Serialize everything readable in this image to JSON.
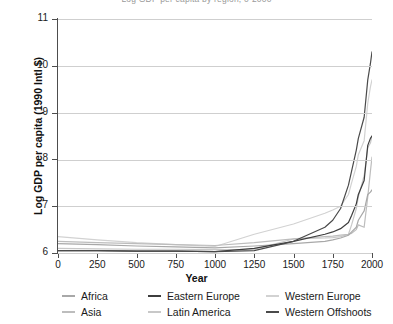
{
  "title": "Log GDP per capita by region, 0-2000",
  "axes": {
    "ylabel": "Log GDP per capita (1990 Intl $)",
    "xlabel": "Year",
    "yticks": [
      "11",
      "10",
      "9",
      "8",
      "7",
      "6"
    ],
    "xticks": [
      "0",
      "250",
      "500",
      "750",
      "1000",
      "1250",
      "1500",
      "1750",
      "2000"
    ]
  },
  "legend": {
    "row1": [
      {
        "label": "Africa",
        "color": "#a8a8a8"
      },
      {
        "label": "Eastern Europe",
        "color": "#3d3d3d"
      },
      {
        "label": "Western Europe",
        "color": "#d2d2d2"
      }
    ],
    "row2": [
      {
        "label": "Asia",
        "color": "#bdbdbd"
      },
      {
        "label": "Latin America",
        "color": "#c8c8c8"
      },
      {
        "label": "Western Offshoots",
        "color": "#4a4a4a"
      }
    ]
  },
  "chart_data": {
    "type": "line",
    "title": "Log GDP per capita by region, 0-2000",
    "xlabel": "Year",
    "ylabel": "Log GDP per capita (1990 Intl $)",
    "xlim": [
      0,
      2000
    ],
    "ylim": [
      6,
      11
    ],
    "xtick_step": 250,
    "ytick_step": 1,
    "grid": "horizontal",
    "legend_position": "below-axis",
    "x": [
      0,
      250,
      500,
      750,
      1000,
      1250,
      1500,
      1700,
      1750,
      1800,
      1850,
      1870,
      1900,
      1913,
      1950,
      1973,
      1990,
      2000
    ],
    "series": [
      {
        "name": "Africa",
        "color": "#a8a8a8",
        "values": [
          6.2,
          6.18,
          6.15,
          6.13,
          6.11,
          6.15,
          6.2,
          6.25,
          6.28,
          6.32,
          6.38,
          6.45,
          6.55,
          6.7,
          6.9,
          7.25,
          7.3,
          7.35
        ]
      },
      {
        "name": "Asia",
        "color": "#bdbdbd",
        "values": [
          6.25,
          6.22,
          6.2,
          6.18,
          6.16,
          6.22,
          6.3,
          6.35,
          6.36,
          6.38,
          6.4,
          6.42,
          6.5,
          6.6,
          6.55,
          7.2,
          7.75,
          8.05
        ]
      },
      {
        "name": "Eastern Europe",
        "color": "#3d3d3d",
        "values": [
          6.05,
          6.05,
          6.04,
          6.04,
          6.03,
          6.1,
          6.25,
          6.4,
          6.45,
          6.52,
          6.65,
          6.8,
          7.05,
          7.25,
          7.55,
          8.3,
          8.45,
          8.5
        ]
      },
      {
        "name": "Latin America",
        "color": "#c8c8c8",
        "values": [
          6.1,
          6.09,
          6.08,
          6.08,
          6.07,
          6.08,
          6.3,
          6.32,
          6.33,
          6.35,
          6.4,
          6.6,
          6.95,
          7.2,
          7.65,
          8.25,
          8.35,
          8.5
        ]
      },
      {
        "name": "Western Europe",
        "color": "#d2d2d2",
        "values": [
          6.35,
          6.28,
          6.22,
          6.18,
          6.14,
          6.4,
          6.62,
          6.85,
          6.92,
          7.0,
          7.25,
          7.5,
          7.85,
          8.1,
          8.4,
          9.2,
          9.55,
          9.7
        ]
      },
      {
        "name": "Western Offshoots",
        "color": "#4a4a4a",
        "values": [
          6.05,
          6.05,
          6.04,
          6.04,
          6.03,
          6.05,
          6.25,
          6.55,
          6.7,
          6.95,
          7.45,
          7.75,
          8.2,
          8.45,
          8.9,
          9.7,
          10.05,
          10.3
        ]
      }
    ]
  }
}
